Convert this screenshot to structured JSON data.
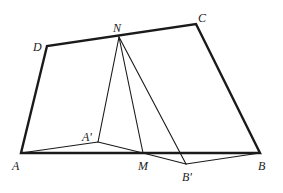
{
  "diagram": {
    "type": "geometry-figure",
    "colors": {
      "background": "#ffffff",
      "stroke": "#1a1a1a",
      "label": "#222222"
    },
    "points": {
      "A": {
        "label": "A",
        "x": 21,
        "y": 153,
        "lx": 12,
        "ly": 170
      },
      "B": {
        "label": "B",
        "x": 260,
        "y": 153,
        "lx": 258,
        "ly": 170
      },
      "C": {
        "label": "C",
        "x": 196,
        "y": 24,
        "lx": 198,
        "ly": 22
      },
      "D": {
        "label": "D",
        "x": 47,
        "y": 46,
        "lx": 33,
        "ly": 51
      },
      "N": {
        "label": "N",
        "x": 119,
        "y": 37,
        "lx": 113,
        "ly": 32
      },
      "M": {
        "label": "M",
        "x": 143,
        "y": 153,
        "lx": 138,
        "ly": 170
      },
      "A_prime": {
        "label": "A'",
        "x": 98,
        "y": 142,
        "lx": 82,
        "ly": 141
      },
      "B_prime": {
        "label": "B'",
        "x": 186,
        "y": 164,
        "lx": 182,
        "ly": 181
      }
    },
    "quadrilateral": {
      "name": "ABCD",
      "edges": [
        [
          "A",
          "B"
        ],
        [
          "B",
          "C"
        ],
        [
          "C",
          "D"
        ],
        [
          "D",
          "A"
        ]
      ],
      "stroke_width": 2.4
    },
    "fold_lines": {
      "edges": [
        [
          "N",
          "A_prime"
        ],
        [
          "N",
          "M"
        ],
        [
          "N",
          "B_prime"
        ],
        [
          "A",
          "A_prime"
        ],
        [
          "A_prime",
          "M"
        ],
        [
          "M",
          "B_prime"
        ],
        [
          "B_prime",
          "B"
        ]
      ],
      "stroke_width": 1.1
    }
  }
}
